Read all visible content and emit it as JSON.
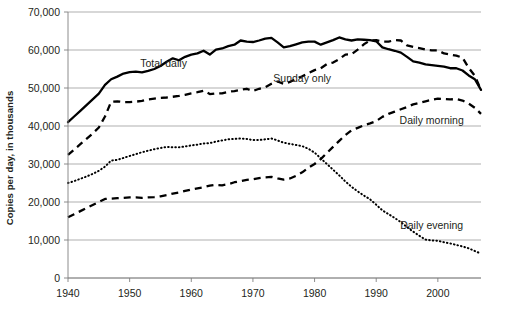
{
  "chart_data": {
    "type": "line",
    "title": "",
    "subtitle": "",
    "xlabel": "",
    "ylabel": "Copies per day, in thousands",
    "xlim": [
      1940,
      2007
    ],
    "ylim": [
      0,
      70000
    ],
    "grid": true,
    "legend_position": "inline-annotations",
    "xticks": [
      1940,
      1950,
      1960,
      1970,
      1980,
      1990,
      2000
    ],
    "xtick_labels": [
      "1940",
      "1950",
      "1960",
      "1970",
      "1980",
      "1990",
      "2000"
    ],
    "yticks": [
      0,
      10000,
      20000,
      30000,
      40000,
      50000,
      60000,
      70000
    ],
    "ytick_labels": [
      "0",
      "10,000",
      "20,000",
      "30,000",
      "40,000",
      "50,000",
      "60,000",
      "70,000"
    ],
    "annotations": [
      {
        "text": "Total daily",
        "x": 1955.5,
        "y": 55500
      },
      {
        "text": "Sunday only",
        "x": 1978.0,
        "y": 51500
      },
      {
        "text": "Daily morning",
        "x": 1999.0,
        "y": 40500
      },
      {
        "text": "Daily evening",
        "x": 1999.0,
        "y": 12800
      }
    ],
    "x": [
      1940,
      1941,
      1942,
      1943,
      1944,
      1945,
      1946,
      1947,
      1948,
      1949,
      1950,
      1951,
      1952,
      1953,
      1954,
      1955,
      1956,
      1957,
      1958,
      1959,
      1960,
      1961,
      1962,
      1963,
      1964,
      1965,
      1966,
      1967,
      1968,
      1969,
      1970,
      1971,
      1972,
      1973,
      1974,
      1975,
      1976,
      1977,
      1978,
      1979,
      1980,
      1981,
      1982,
      1983,
      1984,
      1985,
      1986,
      1987,
      1988,
      1989,
      1990,
      1991,
      1992,
      1993,
      1994,
      1995,
      1996,
      1997,
      1998,
      1999,
      2000,
      2001,
      2002,
      2003,
      2004,
      2005,
      2006,
      2007
    ],
    "series": [
      {
        "name": "Total daily",
        "style": "solid",
        "color": "#000000",
        "values": [
          41000,
          42500,
          44000,
          45500,
          47000,
          48500,
          50800,
          52300,
          53000,
          53800,
          54200,
          54300,
          54100,
          54500,
          55000,
          55800,
          56900,
          57800,
          57300,
          58200,
          58800,
          59100,
          59800,
          58800,
          60100,
          60400,
          61000,
          61400,
          62500,
          62200,
          62100,
          62500,
          63000,
          63200,
          62000,
          60700,
          61000,
          61500,
          62000,
          62200,
          62200,
          61400,
          62000,
          62600,
          63300,
          62800,
          62500,
          62800,
          62700,
          62600,
          62300,
          60700,
          60200,
          59800,
          59300,
          58200,
          57000,
          56700,
          56200,
          56000,
          55800,
          55600,
          55200,
          55200,
          54600,
          53300,
          52300,
          49500
        ]
      },
      {
        "name": "Sunday only",
        "style": "dashed",
        "color": "#000000",
        "values": [
          32400,
          33800,
          35200,
          36600,
          38000,
          39600,
          42500,
          46400,
          46500,
          46300,
          46300,
          46400,
          46600,
          47000,
          47200,
          47400,
          47500,
          47700,
          47900,
          48200,
          48600,
          48900,
          49300,
          48400,
          48600,
          48600,
          49000,
          49200,
          49500,
          49800,
          49200,
          49800,
          50200,
          51100,
          51700,
          51100,
          51600,
          52400,
          53100,
          53900,
          54700,
          55200,
          56300,
          56700,
          57600,
          58800,
          58900,
          60100,
          61500,
          62500,
          62600,
          62200,
          62200,
          62600,
          62500,
          61200,
          60800,
          60500,
          60100,
          59900,
          59900,
          59100,
          58800,
          58500,
          58000,
          55300,
          53200,
          49500
        ]
      },
      {
        "name": "Daily morning",
        "style": "dashed",
        "color": "#000000",
        "values": [
          16000,
          16800,
          17600,
          18400,
          19200,
          20000,
          20800,
          20900,
          21000,
          21100,
          21200,
          21200,
          21100,
          21200,
          21300,
          21500,
          21800,
          22200,
          22500,
          22900,
          23300,
          23600,
          23900,
          24300,
          24500,
          24400,
          24700,
          25200,
          25500,
          25800,
          26000,
          26300,
          26500,
          26600,
          26200,
          25900,
          26200,
          26900,
          27800,
          29000,
          30000,
          31300,
          32900,
          34500,
          36100,
          37600,
          38900,
          39500,
          40200,
          40700,
          41300,
          42400,
          43200,
          43800,
          44400,
          45000,
          45700,
          46100,
          46500,
          46900,
          47200,
          47100,
          47000,
          47100,
          46700,
          45900,
          44800,
          43200
        ]
      },
      {
        "name": "Daily evening",
        "style": "dotted",
        "color": "#000000",
        "values": [
          25000,
          25500,
          26100,
          26700,
          27400,
          28200,
          29300,
          30900,
          31100,
          31600,
          32100,
          32600,
          33100,
          33500,
          33900,
          34200,
          34500,
          34400,
          34400,
          34600,
          34900,
          35100,
          35400,
          35500,
          35900,
          36200,
          36500,
          36600,
          36700,
          36600,
          36300,
          36300,
          36500,
          36700,
          36200,
          35600,
          35300,
          35000,
          34700,
          34000,
          33000,
          31500,
          30000,
          28500,
          27000,
          25400,
          24000,
          22800,
          21700,
          20700,
          19300,
          17800,
          16800,
          15800,
          14700,
          13400,
          12200,
          11100,
          10100,
          9900,
          9800,
          9400,
          9100,
          8700,
          8300,
          7800,
          7100,
          6400
        ]
      }
    ]
  }
}
